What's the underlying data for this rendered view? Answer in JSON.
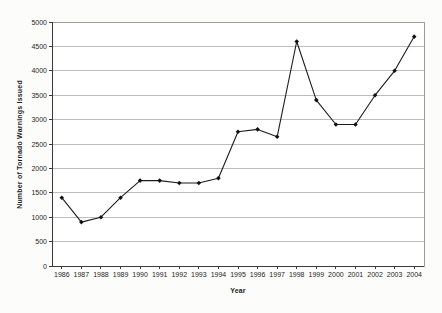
{
  "chart": {
    "title": "",
    "ylabel": "Number of Tornado Warnings Issued",
    "xlabel": "Year"
  },
  "chart_data": {
    "type": "line",
    "categories": [
      "1986",
      "1987",
      "1988",
      "1989",
      "1990",
      "1991",
      "1992",
      "1993",
      "1994",
      "1995",
      "1996",
      "1997",
      "1998",
      "1999",
      "2000",
      "2001",
      "2002",
      "2003",
      "2004"
    ],
    "values": [
      1400,
      900,
      1000,
      1400,
      1750,
      1750,
      1700,
      1700,
      1800,
      2750,
      2800,
      2650,
      4600,
      3400,
      2900,
      2900,
      3500,
      4000,
      4700
    ],
    "series": [
      {
        "name": "Number of Tornado Warnings Issued",
        "values": [
          1400,
          900,
          1000,
          1400,
          1750,
          1750,
          1700,
          1700,
          1800,
          2750,
          2800,
          2650,
          4600,
          3400,
          2900,
          2900,
          3500,
          4000,
          4700
        ]
      }
    ],
    "title": "",
    "xlabel": "Year",
    "ylabel": "Number of Tornado Warnings Issued",
    "ylim": [
      0,
      5000
    ],
    "ytick_step": 500,
    "yticks": [
      0,
      500,
      1000,
      1500,
      2000,
      2500,
      3000,
      3500,
      4000,
      4500,
      5000
    ],
    "grid": true,
    "legend": false,
    "marker": "diamond",
    "colors": {
      "line": "#1c1c1c",
      "marker": "#111111",
      "gridline": "#bdbdbd",
      "axis": "#3a3a3a",
      "plot_border": "#9c9c9c",
      "plot_background": "#ffffff",
      "text": "#1f1f1f"
    }
  }
}
